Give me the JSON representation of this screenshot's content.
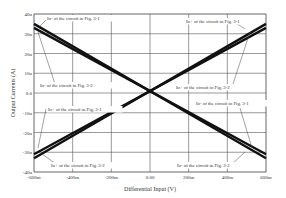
{
  "chart_data": {
    "type": "line",
    "title": "",
    "xlabel": "Differential Input (V)",
    "ylabel": "Output Currents (A)",
    "xlim": [
      -0.6,
      0.6
    ],
    "ylim": [
      -40,
      40
    ],
    "grid": true,
    "x_ticks": [
      "-600m",
      "-400m",
      "-200m",
      "0.00",
      "200m",
      "400m",
      "600m"
    ],
    "y_ticks": [
      "40u",
      "30u",
      "20u",
      "10u",
      "0.0",
      "-10u",
      "-20u",
      "-30u",
      "-40u"
    ],
    "x": [
      -0.6,
      0.6
    ],
    "series": [
      {
        "name": "Io+ of the circuit in Fig. 3-1",
        "values": [
          -31,
          33
        ]
      },
      {
        "name": "Io+ of the circuit in Fig. 3-2",
        "values": [
          -33,
          35
        ]
      },
      {
        "name": "Io- of the circuit in Fig. 3-1",
        "values": [
          33,
          -31
        ]
      },
      {
        "name": "Io- of the circuit in Fig. 3-2",
        "values": [
          35,
          -33
        ]
      }
    ],
    "annotations": [
      {
        "text": "Io- of the circuit in Fig. 3-1",
        "x": 47,
        "y": 20
      },
      {
        "text": "Io- of the circuit in Fig. 3-2",
        "x": 40,
        "y": 87
      },
      {
        "text": "Io+ of the circuit in Fig. 3-1",
        "x": 186,
        "y": 23
      },
      {
        "text": "Io+ of the circuit in Fig. 3-2",
        "x": 176,
        "y": 89
      },
      {
        "text": "Io+ of the circuit in Fig. 3-1",
        "x": 48,
        "y": 111
      },
      {
        "text": "Io+ of the circuit in Fig. 3-2",
        "x": 51,
        "y": 167
      },
      {
        "text": "Io- of the circuit in Fig. 3-1",
        "x": 196,
        "y": 105
      },
      {
        "text": "Io- of the circuit in Fig. 3-2",
        "x": 177,
        "y": 167
      }
    ]
  }
}
